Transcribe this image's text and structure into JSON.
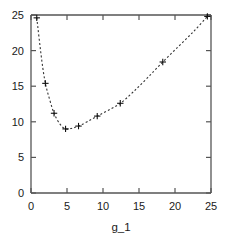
{
  "chart_data": {
    "type": "line",
    "title": "",
    "subtitle": "",
    "xlabel": "g_1",
    "ylabel": "",
    "xlim": [
      0,
      25
    ],
    "ylim": [
      0,
      25
    ],
    "xticks": [
      0,
      5,
      10,
      15,
      20,
      25
    ],
    "yticks": [
      0,
      5,
      10,
      15,
      20,
      25
    ],
    "xtick_labels": [
      "0",
      "5",
      "10",
      "15",
      "20",
      "25"
    ],
    "ytick_labels": [
      "0",
      "5",
      "10",
      "15",
      "20",
      "25"
    ],
    "grid": false,
    "legend": null,
    "legend_position": "none",
    "line_style": "dashed",
    "marker": "plus",
    "line_color": "#333333",
    "marker_color": "#111111",
    "axis_color": "#555555",
    "background_color": "#ffffff",
    "annotations": [],
    "series": [
      {
        "name": "curve",
        "x": [
          0.8,
          1.5,
          2.0,
          2.6,
          3.2,
          4.0,
          4.8,
          5.7,
          6.6,
          7.8,
          9.2,
          10.7,
          12.4,
          14.2,
          16.2,
          18.3,
          20.5,
          22.6,
          24.5
        ],
        "y": [
          24.6,
          18.6,
          15.4,
          13.1,
          11.2,
          9.7,
          9.0,
          9.1,
          9.4,
          10.0,
          10.8,
          11.6,
          12.6,
          14.2,
          16.2,
          18.4,
          20.6,
          22.7,
          24.8
        ]
      }
    ],
    "marker_points": {
      "x": [
        0.8,
        2.0,
        3.2,
        4.8,
        6.6,
        9.2,
        12.4,
        18.3,
        24.5
      ],
      "y": [
        24.6,
        15.4,
        11.2,
        9.0,
        9.4,
        10.8,
        12.6,
        18.4,
        24.8
      ]
    }
  }
}
